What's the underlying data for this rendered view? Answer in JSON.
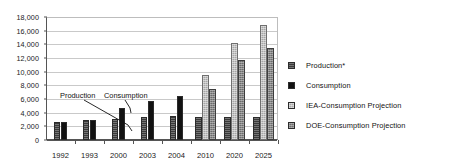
{
  "chart_data": {
    "type": "bar",
    "title": "",
    "subtitle": "",
    "xlabel": "",
    "ylabel": "",
    "ylim": [
      0,
      18000
    ],
    "ytick_step": 2000,
    "ytick_labels": [
      "18,000",
      "16,000",
      "14,000",
      "12,000",
      "10,000",
      "8,000",
      "6,000",
      "4,000",
      "2,000",
      "0"
    ],
    "ytick_values": [
      18000,
      16000,
      14000,
      12000,
      10000,
      8000,
      6000,
      4000,
      2000,
      0
    ],
    "grid": true,
    "grid_axis": "y",
    "legend_position": "right",
    "categories": [
      "1992",
      "1993",
      "2000",
      "2003",
      "2004",
      "2010",
      "2020",
      "2025"
    ],
    "series": [
      {
        "name": "Production*",
        "color": "#3a3a3a",
        "pattern": "horizontal-hatch",
        "values": [
          2650,
          2950,
          3050,
          3300,
          3450,
          3400,
          3400,
          3400
        ]
      },
      {
        "name": "Consumption",
        "color": "#121212",
        "pattern": "solid",
        "values": [
          2650,
          2950,
          4700,
          5750,
          6500,
          null,
          null,
          null
        ]
      },
      {
        "name": "IEA-Consumption Projection",
        "color": "#a6a6a6",
        "pattern": "fine-grid",
        "values": [
          null,
          null,
          null,
          null,
          null,
          9550,
          14200,
          16800
        ]
      },
      {
        "name": "DOE-Consumption Projection",
        "color": "#6b6b6b",
        "pattern": "dense-grid",
        "values": [
          null,
          null,
          null,
          null,
          null,
          7450,
          11700,
          13400
        ]
      }
    ],
    "annotations": [
      {
        "text": "Production",
        "target_category": "2000",
        "target_series": "Production*"
      },
      {
        "text": "Consumption",
        "target_category": "2000",
        "target_series": "Consumption"
      }
    ]
  },
  "legend": {
    "items": [
      {
        "label": "Production*"
      },
      {
        "label": "Consumption"
      },
      {
        "label": "IEA-Consumption Projection"
      },
      {
        "label": "DOE-Consumption Projection"
      }
    ]
  }
}
